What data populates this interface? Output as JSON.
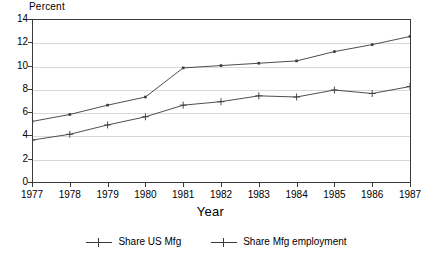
{
  "chart_data": {
    "type": "line",
    "title": "",
    "xlabel": "Year",
    "ylabel": "Percent",
    "x": [
      1977,
      1978,
      1979,
      1980,
      1981,
      1982,
      1983,
      1984,
      1985,
      1986,
      1987
    ],
    "xtick_labels": [
      "1977",
      "1978",
      "1979",
      "1980",
      "1981",
      "1982",
      "1983",
      "1984",
      "1985",
      "1986",
      "1987"
    ],
    "ytick_labels": [
      "0",
      "2",
      "4",
      "6",
      "8",
      "10",
      "12",
      "14"
    ],
    "yticks": [
      0,
      2,
      4,
      6,
      8,
      10,
      12,
      14
    ],
    "xlim": [
      1977,
      1987
    ],
    "ylim": [
      0,
      14
    ],
    "grid": "horizontal",
    "legend_position": "bottom",
    "series": [
      {
        "name": "Share US Mfg",
        "marker": "square-dot",
        "color": "#3a3a3a",
        "values": [
          5.2,
          5.8,
          6.6,
          7.3,
          9.8,
          10.0,
          10.2,
          10.4,
          11.2,
          11.8,
          12.5
        ]
      },
      {
        "name": "Share Mfg employment",
        "marker": "plus",
        "color": "#3a3a3a",
        "values": [
          3.6,
          4.1,
          4.9,
          5.6,
          6.6,
          6.9,
          7.4,
          7.3,
          7.9,
          7.6,
          8.2
        ]
      }
    ]
  },
  "axis": {
    "y_title": "Percent",
    "x_title": "Year"
  },
  "colors": {
    "line": "#3a3a3a",
    "grid": "#d9d9d9",
    "frame": "#3a3a3a",
    "background": "#ffffff"
  }
}
